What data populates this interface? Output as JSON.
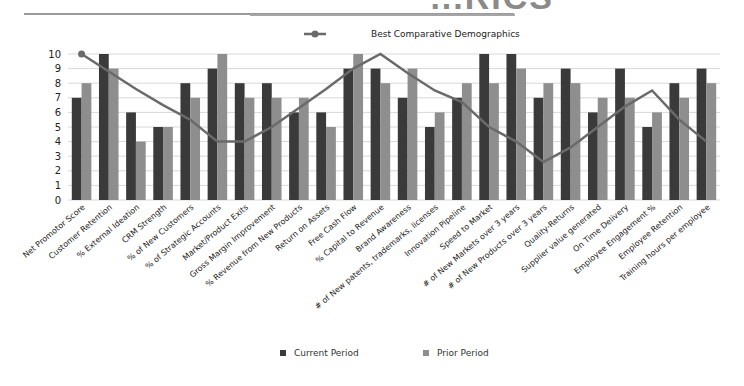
{
  "title": {
    "visible_text": "...RICS"
  },
  "colors": {
    "current": "#3a3a3a",
    "prior": "#8e8e8e",
    "line": "#6a6a6a",
    "grid": "#d8d8d8",
    "axis_text": "#222222"
  },
  "legend": {
    "line_label": "Best Comparative Demographics",
    "current_label": "Current Period",
    "prior_label": "Prior Period"
  },
  "chart_data": {
    "type": "bar",
    "title": "",
    "xlabel": "",
    "ylabel": "",
    "ylim": [
      0,
      10
    ],
    "yticks": [
      0,
      1,
      2,
      3,
      4,
      5,
      6,
      7,
      8,
      9,
      10
    ],
    "grid": true,
    "legend_position": "top (line) / bottom (bars)",
    "categories": [
      "Net Promotor Score",
      "Customer Retention",
      "% External Ideation",
      "CRM Strength",
      "% of New Customers",
      "% of Strategic Accounts",
      "Market/Product Exits",
      "Gross Margin Improvement",
      "% Revenue from New Products",
      "Return on Assets",
      "Free Cash Flow",
      "% Capital to Revenue",
      "Brand Awareness",
      "# of New patents, trademarks, licenses",
      "Innovation Pipeline",
      "Speed to Market",
      "# of New Markets over 3 years",
      "# of New Products over 3 years",
      "Quality-Returns",
      "Supplier value generated",
      "On Time Delivery",
      "Employee Engagement %",
      "Employee Retention",
      "Training hours per employee"
    ],
    "series": [
      {
        "name": "Current Period",
        "type": "bar",
        "values": [
          7,
          10,
          6,
          5,
          8,
          9,
          8,
          8,
          6,
          6,
          9,
          9,
          7,
          5,
          7,
          10,
          10,
          7,
          9,
          6,
          9,
          5,
          8,
          9
        ]
      },
      {
        "name": "Prior Period",
        "type": "bar",
        "values": [
          8,
          9,
          4,
          5,
          7,
          10,
          7,
          7,
          7,
          5,
          10,
          8,
          9,
          6,
          8,
          8,
          9,
          8,
          8,
          7,
          7,
          6,
          7,
          8
        ]
      },
      {
        "name": "Best Comparative Demographics",
        "type": "line",
        "values": [
          10,
          8.8,
          7.6,
          6.5,
          5.5,
          4,
          4,
          5,
          6.3,
          7.6,
          9,
          10,
          8.7,
          7.5,
          6.7,
          5,
          4,
          2.6,
          3.6,
          5,
          6.4,
          7.5,
          5.5,
          4
        ]
      }
    ]
  }
}
